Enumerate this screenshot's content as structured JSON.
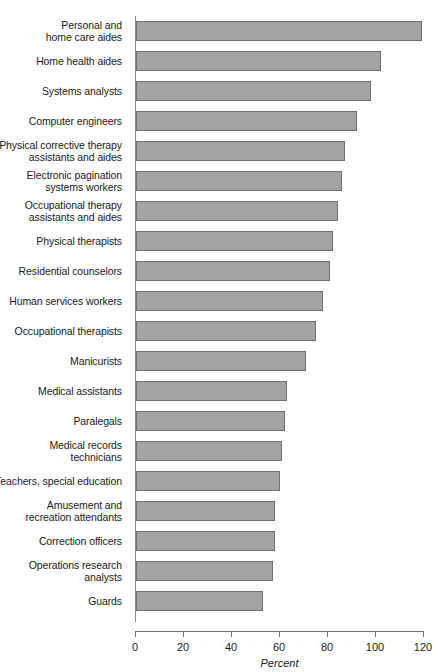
{
  "chart_data": {
    "type": "bar",
    "orientation": "horizontal",
    "title": "",
    "xlabel": "Percent",
    "ylabel": "",
    "xlim": [
      0,
      120
    ],
    "xticks": [
      0,
      20,
      40,
      60,
      80,
      100,
      120
    ],
    "grid": false,
    "legend": null,
    "bar_color": "#a3a3a3",
    "bar_edge_color": "#6f6f6f",
    "categories": [
      "Personal and home care aides",
      "Home health aides",
      "Systems analysts",
      "Computer engineers",
      "Physical corrective therapy assistants and aides",
      "Electronic pagination systems workers",
      "Occupational therapy assistants and aides",
      "Physical therapists",
      "Residential counselors",
      "Human services workers",
      "Occupational therapists",
      "Manicurists",
      "Medical assistants",
      "Paralegals",
      "Medical records technicians",
      "Teachers, special education",
      "Amusement and recreation attendants",
      "Correction officers",
      "Operations research analysts",
      "Guards"
    ],
    "values": [
      119,
      102,
      98,
      92,
      87,
      86,
      84,
      82,
      81,
      78,
      75,
      71,
      63,
      62,
      61,
      60,
      58,
      58,
      57,
      53
    ]
  },
  "axis": {
    "tick_labels": [
      "0",
      "20",
      "40",
      "60",
      "80",
      "100",
      "120"
    ],
    "x_title": "Percent"
  },
  "rows": [
    {
      "label_lines": [
        "Personal and",
        "home care aides"
      ],
      "value": 119
    },
    {
      "label_lines": [
        "Home health aides"
      ],
      "value": 102
    },
    {
      "label_lines": [
        "Systems analysts"
      ],
      "value": 98
    },
    {
      "label_lines": [
        "Computer engineers"
      ],
      "value": 92
    },
    {
      "label_lines": [
        "Physical corrective therapy",
        "assistants and aides"
      ],
      "value": 87
    },
    {
      "label_lines": [
        "Electronic pagination",
        "systems workers"
      ],
      "value": 86
    },
    {
      "label_lines": [
        "Occupational therapy",
        "assistants and aides"
      ],
      "value": 84
    },
    {
      "label_lines": [
        "Physical therapists"
      ],
      "value": 82
    },
    {
      "label_lines": [
        "Residential counselors"
      ],
      "value": 81
    },
    {
      "label_lines": [
        "Human services workers"
      ],
      "value": 78
    },
    {
      "label_lines": [
        "Occupational therapists"
      ],
      "value": 75
    },
    {
      "label_lines": [
        "Manicurists"
      ],
      "value": 71
    },
    {
      "label_lines": [
        "Medical assistants"
      ],
      "value": 63
    },
    {
      "label_lines": [
        "Paralegals"
      ],
      "value": 62
    },
    {
      "label_lines": [
        "Medical records",
        "technicians"
      ],
      "value": 61
    },
    {
      "label_lines": [
        "Teachers, special education"
      ],
      "value": 60
    },
    {
      "label_lines": [
        "Amusement and",
        "recreation attendants"
      ],
      "value": 58
    },
    {
      "label_lines": [
        "Correction officers"
      ],
      "value": 58
    },
    {
      "label_lines": [
        "Operations research",
        "analysts"
      ],
      "value": 57
    },
    {
      "label_lines": [
        "Guards"
      ],
      "value": 53
    }
  ]
}
